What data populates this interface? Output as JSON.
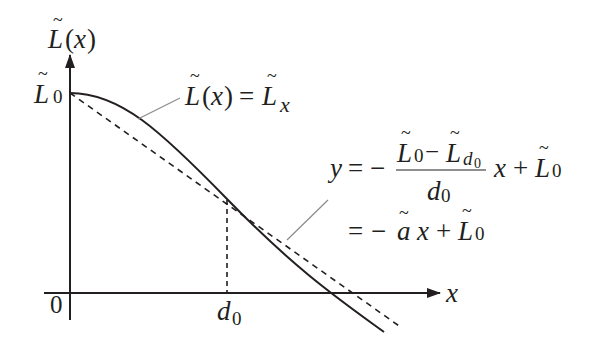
{
  "diagram": {
    "y_axis_label": {
      "base": "L",
      "arg": "(x)",
      "tilde": true
    },
    "x_axis_label": "x",
    "origin_label": "0",
    "y_intercept_label": {
      "base": "L",
      "sub": "0",
      "tilde": true
    },
    "d0_label": {
      "base": "d",
      "sub": "0"
    },
    "curve_label": {
      "lhs_base": "L",
      "lhs_arg": "(x)",
      "eq": "=",
      "rhs_base": "L",
      "rhs_sub": "x"
    },
    "line_equation": {
      "y": "y",
      "eq": "=",
      "minus": "−",
      "num_left": "L",
      "num_left_sub": "0",
      "num_minus": "−",
      "num_right": "L",
      "num_right_sub": "d",
      "num_right_subsub": "0",
      "den": "d",
      "den_sub": "0",
      "x": "x",
      "plus": "+",
      "const": "L",
      "const_sub": "0"
    },
    "line_equation_simplified": {
      "eq": "=",
      "minus": "−",
      "a": "a",
      "x": "x",
      "plus": "+",
      "const": "L",
      "const_sub": "0"
    },
    "elements": {
      "curve": "solid decreasing concave curve L(x)",
      "tangent_line": "dashed secant line through (0, L0) and (d0, L_d0)",
      "drop_line": "dashed vertical from intersection to d0"
    },
    "colors": {
      "ink": "#231f20",
      "leader": "#8a8a8a"
    }
  }
}
